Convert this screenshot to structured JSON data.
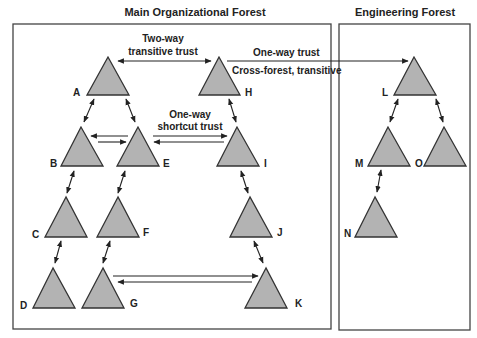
{
  "diagram": {
    "forests": [
      {
        "id": "main",
        "title": "Main Organizational Forest"
      },
      {
        "id": "engineering",
        "title": "Engineering Forest"
      }
    ],
    "domains": {
      "A": "A",
      "B": "B",
      "C": "C",
      "D": "D",
      "E": "E",
      "F": "F",
      "G": "G",
      "H": "H",
      "I": "I",
      "J": "J",
      "K": "K",
      "L": "L",
      "M": "M",
      "N": "N",
      "O": "O"
    },
    "trust_labels": {
      "two_way_line1": "Two-way",
      "two_way_line2": "transitive trust",
      "one_way_trust": "One-way trust",
      "cross_forest": "Cross-forest, transitive",
      "shortcut_line1": "One-way",
      "shortcut_line2": "shortcut trust"
    },
    "trusts": [
      {
        "from": "A",
        "to": "H",
        "type": "two-way transitive"
      },
      {
        "from": "H",
        "to": "L",
        "type": "one-way cross-forest transitive"
      },
      {
        "from": "B",
        "to": "E",
        "type": "one-way shortcut (pair)"
      },
      {
        "from": "E",
        "to": "I",
        "type": "one-way shortcut (pair)"
      },
      {
        "from": "G",
        "to": "K",
        "type": "one-way shortcut (pair)"
      },
      {
        "from": "A",
        "to": "B",
        "type": "parent-child"
      },
      {
        "from": "A",
        "to": "E",
        "type": "parent-child"
      },
      {
        "from": "B",
        "to": "C",
        "type": "parent-child"
      },
      {
        "from": "C",
        "to": "D",
        "type": "parent-child"
      },
      {
        "from": "E",
        "to": "F",
        "type": "parent-child"
      },
      {
        "from": "F",
        "to": "G",
        "type": "parent-child"
      },
      {
        "from": "H",
        "to": "I",
        "type": "parent-child"
      },
      {
        "from": "I",
        "to": "J",
        "type": "parent-child"
      },
      {
        "from": "J",
        "to": "K",
        "type": "parent-child"
      },
      {
        "from": "L",
        "to": "M",
        "type": "parent-child"
      },
      {
        "from": "L",
        "to": "O",
        "type": "parent-child"
      },
      {
        "from": "M",
        "to": "N",
        "type": "parent-child"
      }
    ]
  }
}
